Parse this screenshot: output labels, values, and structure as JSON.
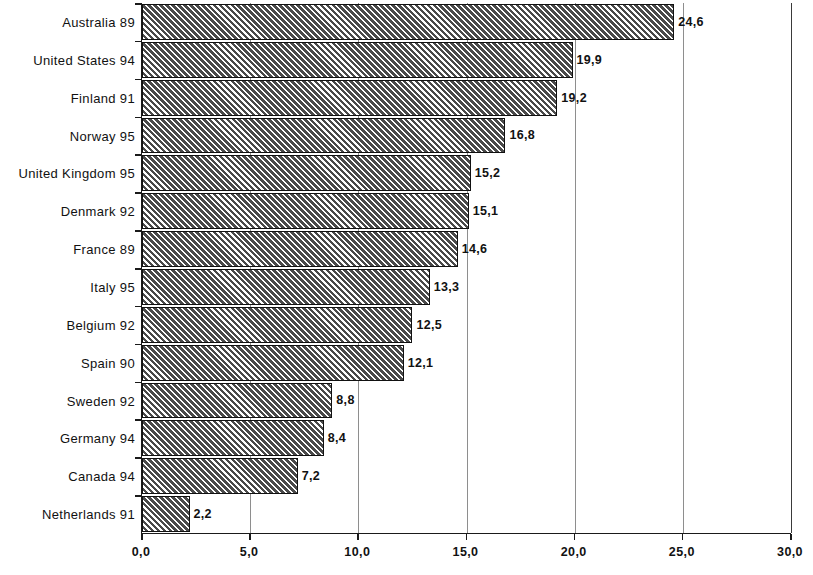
{
  "chart_data": {
    "type": "bar",
    "orientation": "horizontal",
    "title": "",
    "subtitle": "",
    "xlabel": "",
    "ylabel": "",
    "xlim": [
      0,
      30
    ],
    "x_tick_labels": [
      "0,0",
      "5,0",
      "10,0",
      "15,0",
      "20,0",
      "25,0",
      "30,0"
    ],
    "x_ticks": [
      0,
      5,
      10,
      15,
      20,
      25,
      30
    ],
    "grid": "vertical",
    "legend": null,
    "decimal_separator": ",",
    "categories": [
      "Australia 89",
      "United States 94",
      "Finland 91",
      "Norway 95",
      "United Kingdom 95",
      "Denmark 92",
      "France 89",
      "Italy 95",
      "Belgium 92",
      "Spain 90",
      "Sweden 92",
      "Germany 94",
      "Canada 94",
      "Netherlands 91"
    ],
    "values": [
      24.6,
      19.9,
      19.2,
      16.8,
      15.2,
      15.1,
      14.6,
      13.3,
      12.5,
      12.1,
      8.8,
      8.4,
      7.2,
      2.2
    ],
    "value_labels": [
      "24,6",
      "19,9",
      "19,2",
      "16,8",
      "15,2",
      "15,1",
      "14,6",
      "13,3",
      "12,5",
      "12,1",
      "8,8",
      "8,4",
      "7,2",
      "2,2"
    ],
    "bar_fill": "hatched-diagonal-gray",
    "bar_border_color": "#111111",
    "bar_fill_color": "#8d8d8d",
    "gridline_color": "#8e8e8e",
    "axis_color": "#1a1a1a"
  }
}
